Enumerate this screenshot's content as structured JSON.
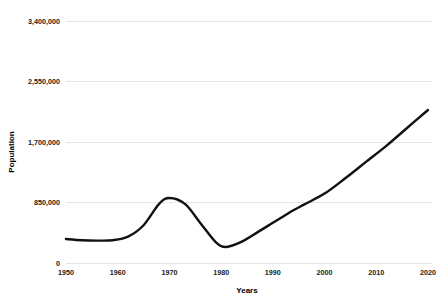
{
  "chart_data": {
    "type": "line",
    "title": "",
    "xlabel": "Years",
    "ylabel": "Population",
    "xlim": [
      1950,
      2020
    ],
    "ylim": [
      0,
      3400000
    ],
    "grid": true,
    "legend": "none",
    "x_ticks": [
      "1950",
      "1960",
      "1970",
      "1980",
      "1990",
      "2000",
      "2010",
      "2020"
    ],
    "x_tick_values": [
      1950,
      1960,
      1970,
      1980,
      1990,
      2000,
      2010,
      2020
    ],
    "y_ticks": [
      "0",
      "850,000",
      "1,700,000",
      "2,550,000",
      "3,400,000"
    ],
    "y_tick_values": [
      0,
      850000,
      1700000,
      2550000,
      3400000
    ],
    "series": [
      {
        "name": "Population",
        "color": "#111111",
        "x": [
          1950,
          1953,
          1956,
          1959,
          1962,
          1965,
          1968,
          1970,
          1973,
          1976,
          1979,
          1981,
          1984,
          1987,
          1990,
          1993,
          1996,
          2000,
          2004,
          2008,
          2012,
          2016,
          2020
        ],
        "values": [
          337000,
          320000,
          315000,
          320000,
          370000,
          530000,
          830000,
          913000,
          830000,
          560000,
          290000,
          225000,
          300000,
          430000,
          565000,
          700000,
          820000,
          975000,
          1190000,
          1420000,
          1650000,
          1900000,
          2150000
        ]
      }
    ]
  },
  "axis": {
    "y_label": "Population",
    "x_label": "Years"
  }
}
